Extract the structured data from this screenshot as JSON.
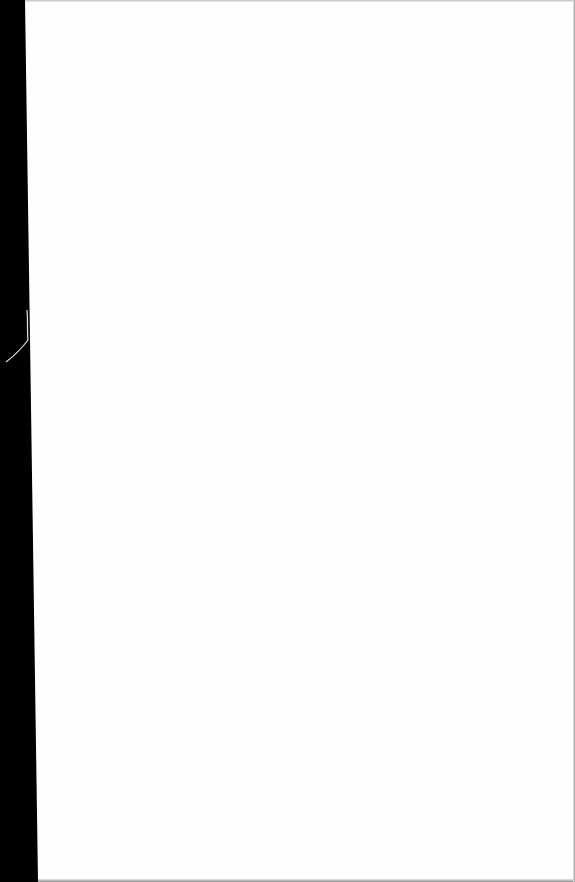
{
  "document": {
    "page_content": "",
    "colors": {
      "page": "#fefefe",
      "binding": "#000000"
    }
  }
}
